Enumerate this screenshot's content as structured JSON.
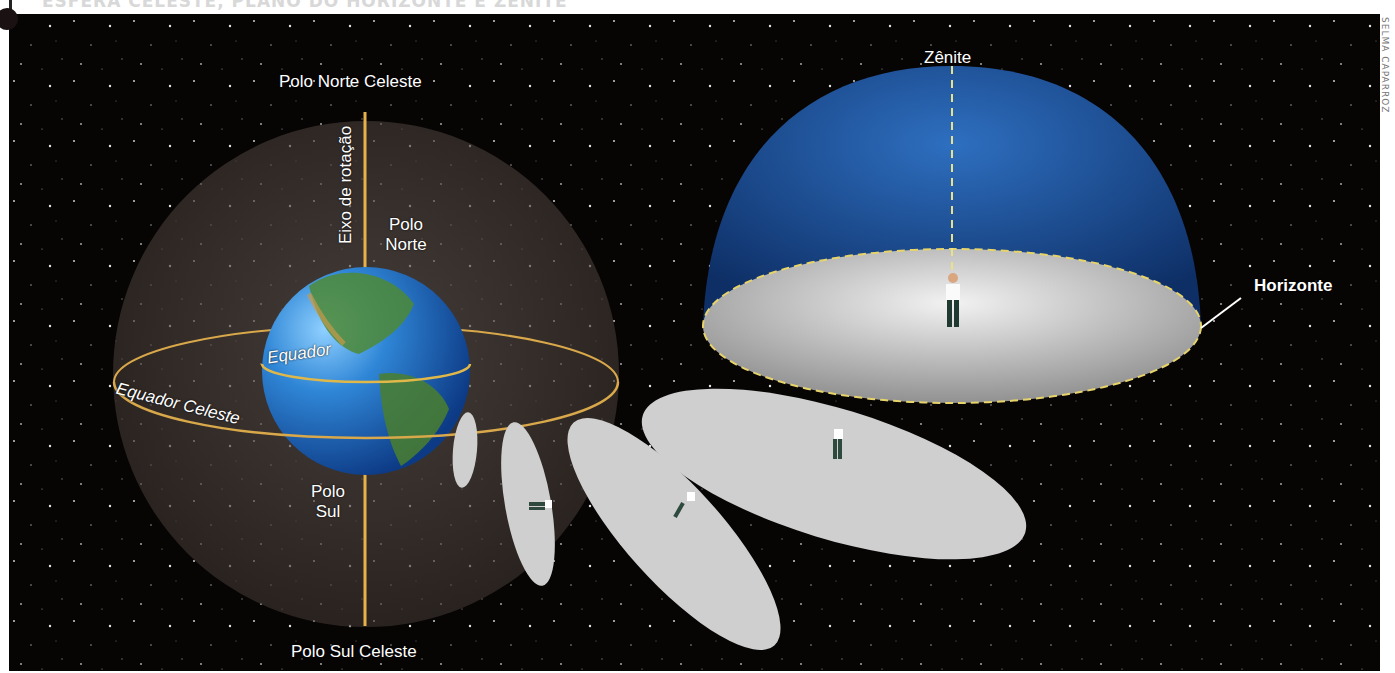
{
  "header": {
    "title": "ESFERA CELESTE, PLANO DO HORIZONTE E ZÊNITE"
  },
  "credit": "SELMA CAPARROZ",
  "celestial_sphere": {
    "north_celestial_pole": "Polo Norte Celeste",
    "south_celestial_pole": "Polo Sul Celeste",
    "rotation_axis": "Eixo de rotação",
    "north_pole_line1": "Polo",
    "north_pole_line2": "Norte",
    "south_pole_line1": "Polo",
    "south_pole_line2": "Sul",
    "equator": "Equador",
    "celestial_equator": "Equador Celeste"
  },
  "horizon_dome": {
    "zenith": "Zênite",
    "horizon": "Horizonte"
  },
  "colors": {
    "background": "#070404",
    "sphere": "#3a3330",
    "axis_line": "#e8b24a",
    "equator_ring": "#d9a84a",
    "dome_blue": "#1f4f96",
    "horizon_plane": "#d6d6d6",
    "observer_planes": "#cfcfcf"
  }
}
